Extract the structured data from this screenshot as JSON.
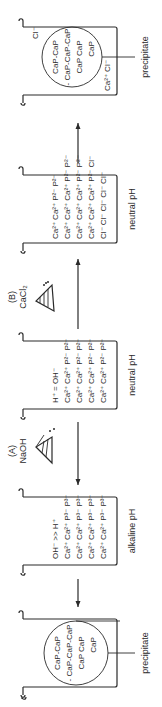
{
  "steps": [
    {
      "id": "precipitate-left",
      "ions_top": "",
      "rows": [
        "CaP-CaP",
        "- CaP-CaP-CaP",
        "CaP   CaP",
        "CaP"
      ],
      "label": "precipitate"
    },
    {
      "id": "alkaline",
      "condition": "OH⁻ >> H⁺",
      "rows": [
        "Ca²⁺ Ca²⁺ P³⁻ P³⁻",
        "Ca²⁺ Ca²⁺ P³⁻ P³⁻",
        "Ca²⁺ Ca²⁺ P³⁻ P³⁻",
        "Ca²⁺ Ca²⁺ P³⁻ P³⁻"
      ],
      "label": "alkaline pH"
    },
    {
      "id": "neutral-1",
      "condition": "H⁺ = OH⁻",
      "rows": [
        "Ca²⁺ Ca²⁺ P²⁻ P²⁻",
        "Ca²⁺ Ca²⁺ P²⁻ P²⁻",
        "Ca²⁺ Ca²⁺ P²⁻ P²⁻",
        "Ca²⁺ Ca²⁺ P²⁻ P²⁻"
      ],
      "label": "neutral pH"
    },
    {
      "id": "neutral-2",
      "condition": "",
      "rows": [
        "Ca²⁺ Ca²⁺ P²⁻ P²⁻",
        "Ca²⁺ Ca²⁺ Ca²⁺ P²⁻ P²⁻",
        "Ca²⁺ Ca²⁺ Ca²⁺ P²⁻ P²⁻",
        "Ca²⁺ Ca²⁺ Ca²⁺ P²⁻ Cl⁻",
        "Cl⁻ Cl⁻ Cl⁻ Cl⁻ Cl⁻"
      ],
      "label": "neutral pH"
    },
    {
      "id": "precipitate-right",
      "ions_top": "Ca²⁺ Cl⁻",
      "ions_corner": "Cl⁻",
      "rows": [
        "CaP-CaP",
        "- CaP-CaP-CaP",
        "CaP   CaP",
        "CaP"
      ],
      "label": "precipitate"
    }
  ],
  "reagents": {
    "a": {
      "letter": "(A)",
      "name": "NaOH"
    },
    "b": {
      "letter": "(B)",
      "name": "CaCl₂"
    }
  }
}
